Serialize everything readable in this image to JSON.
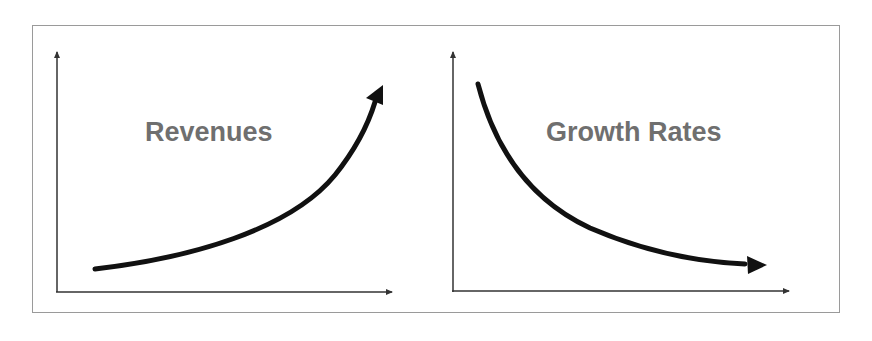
{
  "diagram": {
    "panels": [
      {
        "id": "left",
        "label": "Revenues",
        "trend": "increasing-exponential",
        "curve_color": "#111111"
      },
      {
        "id": "right",
        "label": "Growth Rates",
        "trend": "decreasing-decay",
        "curve_color": "#111111"
      }
    ],
    "colors": {
      "frame": "#9a9a9a",
      "axis": "#333333",
      "label": "#6f6f6f",
      "curve": "#111111"
    }
  }
}
